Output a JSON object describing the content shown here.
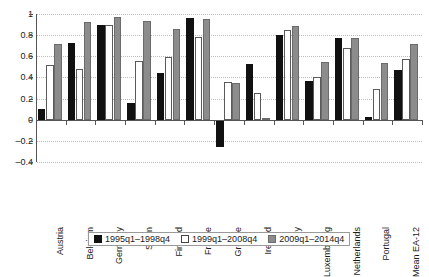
{
  "chart_data": {
    "type": "bar",
    "title": "",
    "subtitle": "",
    "xlabel": "",
    "ylabel": "",
    "ylim": [
      -0.4,
      1
    ],
    "yticks": [
      1,
      0.8,
      0.6,
      0.4,
      0.2,
      0,
      -0.2,
      -0.4
    ],
    "ytick_labels": [
      "1",
      "0.8",
      "0.6",
      "0.4",
      "0.2",
      "0",
      "–0.2",
      "–0.4"
    ],
    "grid": true,
    "legend_position": "bottom",
    "categories": [
      "Austria",
      "Belgium",
      "Germany",
      "Spain",
      "Finland",
      "France",
      "Greece",
      "Ireland",
      "Italy",
      "Luxembourg",
      "Netherlands",
      "Portugal",
      "Mean EA-12"
    ],
    "series": [
      {
        "name": "1995q1–1998q4",
        "color": "#111111",
        "values": [
          0.1,
          0.73,
          0.9,
          0.16,
          0.44,
          0.96,
          -0.26,
          0.53,
          0.8,
          0.37,
          0.77,
          0.03,
          0.47
        ]
      },
      {
        "name": "1999q1–2008q4",
        "color": "#ffffff",
        "values": [
          0.52,
          0.48,
          0.9,
          0.56,
          0.59,
          0.78,
          0.36,
          0.25,
          0.85,
          0.4,
          0.68,
          0.29,
          0.57
        ]
      },
      {
        "name": "2009q1–2014q4",
        "color": "#8c8c8c",
        "values": [
          0.72,
          0.92,
          0.97,
          0.93,
          0.86,
          0.95,
          0.35,
          0.02,
          0.89,
          0.55,
          0.77,
          0.54,
          0.72
        ]
      }
    ]
  }
}
